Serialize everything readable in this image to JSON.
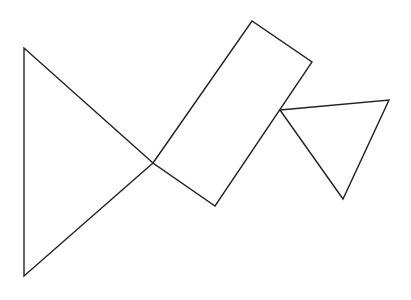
{
  "canvas": {
    "width": 411,
    "height": 300,
    "background": "#ffffff"
  },
  "style": {
    "stroke": "#222222",
    "stroke_width": 1.4
  },
  "shapes": [
    {
      "name": "left-triangle",
      "type": "polygon",
      "points": [
        [
          24,
          48
        ],
        [
          24,
          276
        ],
        [
          153,
          163
        ]
      ]
    },
    {
      "name": "tilted-rectangle",
      "type": "polygon",
      "points": [
        [
          153,
          163
        ],
        [
          252,
          21
        ],
        [
          312,
          62
        ],
        [
          215,
          206
        ]
      ]
    },
    {
      "name": "small-triangle",
      "type": "polygon",
      "points": [
        [
          280,
          110
        ],
        [
          389,
          100
        ],
        [
          343,
          199
        ]
      ]
    }
  ]
}
